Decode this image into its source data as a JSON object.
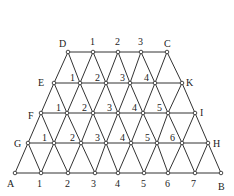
{
  "diagram": {
    "title": "",
    "colors": {
      "line": "#333333",
      "node_fill": "#ffffff",
      "text": "#222222"
    },
    "rows": [
      {
        "name": "row-DC",
        "y": 52,
        "nodes": [
          {
            "x": 68,
            "label": "D",
            "lx": 59,
            "ly": 47
          },
          {
            "x": 93,
            "label": "1",
            "lx": 90,
            "ly": 45
          },
          {
            "x": 118,
            "label": "2",
            "lx": 115,
            "ly": 45
          },
          {
            "x": 141,
            "label": "3",
            "lx": 138,
            "ly": 45
          },
          {
            "x": 167,
            "label": "C",
            "lx": 164,
            "ly": 47
          }
        ]
      },
      {
        "name": "row-EK",
        "y": 83,
        "nodes": [
          {
            "x": 54,
            "label": "E",
            "lx": 38,
            "ly": 86
          },
          {
            "x": 80,
            "label": "1",
            "lx": 70,
            "ly": 81
          },
          {
            "x": 106,
            "label": "2",
            "lx": 95,
            "ly": 81
          },
          {
            "x": 130,
            "label": "3",
            "lx": 120,
            "ly": 81
          },
          {
            "x": 155,
            "label": "4",
            "lx": 144,
            "ly": 81
          },
          {
            "x": 182,
            "label": "K",
            "lx": 186,
            "ly": 86
          }
        ]
      },
      {
        "name": "row-FI",
        "y": 113,
        "nodes": [
          {
            "x": 41,
            "label": "F",
            "lx": 28,
            "ly": 119
          },
          {
            "x": 67,
            "label": "1",
            "lx": 56,
            "ly": 111
          },
          {
            "x": 93,
            "label": "2",
            "lx": 82,
            "ly": 111
          },
          {
            "x": 118,
            "label": "3",
            "lx": 107,
            "ly": 111
          },
          {
            "x": 143,
            "label": "4",
            "lx": 132,
            "ly": 111
          },
          {
            "x": 168,
            "label": "5",
            "lx": 157,
            "ly": 111
          },
          {
            "x": 195,
            "label": "I",
            "lx": 200,
            "ly": 116
          }
        ]
      },
      {
        "name": "row-GH",
        "y": 143,
        "nodes": [
          {
            "x": 28,
            "label": "G",
            "lx": 14,
            "ly": 147
          },
          {
            "x": 54,
            "label": "1",
            "lx": 42,
            "ly": 141
          },
          {
            "x": 81,
            "label": "2",
            "lx": 70,
            "ly": 141
          },
          {
            "x": 106,
            "label": "3",
            "lx": 95,
            "ly": 141
          },
          {
            "x": 131,
            "label": "4",
            "lx": 120,
            "ly": 141
          },
          {
            "x": 157,
            "label": "5",
            "lx": 145,
            "ly": 141
          },
          {
            "x": 182,
            "label": "6",
            "lx": 170,
            "ly": 141
          },
          {
            "x": 208,
            "label": "H",
            "lx": 213,
            "ly": 147
          }
        ]
      },
      {
        "name": "row-AB",
        "y": 173,
        "nodes": [
          {
            "x": 15,
            "label": "A",
            "lx": 7,
            "ly": 187
          },
          {
            "x": 41,
            "label": "1",
            "lx": 37,
            "ly": 187
          },
          {
            "x": 68,
            "label": "2",
            "lx": 65,
            "ly": 187
          },
          {
            "x": 95,
            "label": "3",
            "lx": 91,
            "ly": 187
          },
          {
            "x": 118,
            "label": "4",
            "lx": 115,
            "ly": 187
          },
          {
            "x": 144,
            "label": "5",
            "lx": 141,
            "ly": 187
          },
          {
            "x": 168,
            "label": "6",
            "lx": 165,
            "ly": 187
          },
          {
            "x": 195,
            "label": "7",
            "lx": 191,
            "ly": 187
          },
          {
            "x": 221,
            "label": "B",
            "lx": 218,
            "ly": 190
          }
        ]
      }
    ]
  }
}
